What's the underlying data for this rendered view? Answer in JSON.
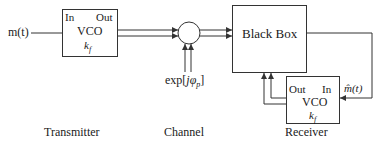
{
  "input_signal": "m(t)",
  "transmitter": {
    "block": "VCO",
    "port_in": "In",
    "port_out": "Out",
    "gain": "k",
    "gain_sub": "f",
    "caption": "Transmitter"
  },
  "channel": {
    "phase_term_prefix": "exp",
    "phase_term_arg": "jφ",
    "phase_term_sub": "p",
    "caption": "Channel"
  },
  "black_box": {
    "label": "Black Box"
  },
  "receiver": {
    "block": "VCO",
    "port_in": "In",
    "port_out": "Out",
    "gain": "k",
    "gain_sub": "f",
    "caption": "Receiver",
    "estimate_signal": "m̂(t)"
  },
  "colors": {
    "line": "#333333",
    "background": "#ffffff"
  }
}
